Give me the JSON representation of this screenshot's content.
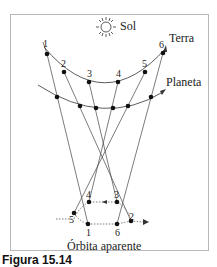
{
  "labels": {
    "sun": "Sol",
    "earth": "Terra",
    "planet": "Planeta",
    "apparent_orbit": "Órbita aparente"
  },
  "earth_positions": [
    "1",
    "2",
    "3",
    "4",
    "5",
    "6"
  ],
  "apparent_positions": [
    "1",
    "2",
    "3",
    "4",
    "5",
    "6"
  ],
  "caption": "Figura 15.14"
}
